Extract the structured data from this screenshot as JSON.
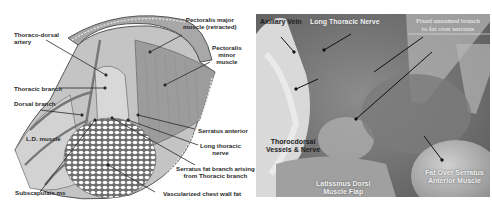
{
  "figure": {
    "left_panel": {
      "type": "anatomical illustration",
      "labels": {
        "thoraco_dorsal_artery": [
          "Thoraco-dorsal",
          "artery"
        ],
        "pectoralis_major": [
          "Pectoralis major",
          "muscle (retracted)"
        ],
        "pectoralis_minor": [
          "Pectoralis",
          "minor",
          "muscle"
        ],
        "thoracic_branch": "Thoracic branch",
        "dorsal_branch": "Dorsal branch",
        "ld_muscle": "L.D. muscle",
        "serratus_anterior": "Serratus anterior",
        "long_thoracic_nerve": [
          "Long thoracic",
          "nerve"
        ],
        "serratus_fat_branch": [
          "Serratus fat branch arising",
          "from  Thoracic branch"
        ],
        "subscapularis": "Subscapulais ms",
        "vascularized_fat": "Vascularized chest wall fat"
      }
    },
    "right_panel": {
      "type": "intraoperative photograph",
      "labels": {
        "axillary_vein": "Axillary Vein",
        "long_thoracic_nerve": "Long Thoracic Nerve",
        "fixed_branch": [
          "Fixed unnamed branch",
          "to fat over serratus"
        ],
        "thorocdorsal": [
          "Thorocdorsal",
          "Vessels & Nerve"
        ],
        "latissimus": [
          "Latissmus Dorsi",
          "Muscle Flap"
        ],
        "fat_over_serratus": [
          "Fat Over Serratus",
          "Anterior Muscle"
        ]
      }
    },
    "colors": {
      "line": "#2a2a2a",
      "muscle_fill": "#b9b9b9",
      "photo_base": "#7d7d7d"
    }
  }
}
